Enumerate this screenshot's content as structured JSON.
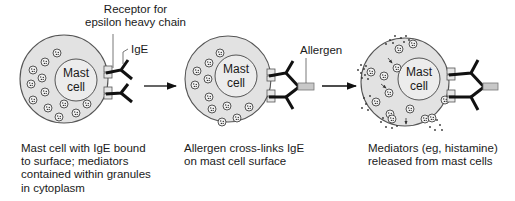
{
  "diagram": {
    "colors": {
      "cell_fill": "#e2e2e2",
      "outline": "#555555",
      "ige": "#111111",
      "receptor_fill": "#e6e6e6",
      "allergen_fill": "#c8c8c8",
      "background": "#ffffff"
    },
    "labels": {
      "receptor": [
        "Receptor for",
        "epsilon heavy chain"
      ],
      "ige": "IgE",
      "allergen": "Allergen"
    },
    "panels": [
      {
        "id": "panel-1",
        "nucleus": [
          "Mast",
          "cell"
        ],
        "caption": [
          "Mast cell with IgE bound",
          "to surface; mediators",
          "contained within granules",
          "in cytoplasm"
        ]
      },
      {
        "id": "panel-2",
        "nucleus": [
          "Mast",
          "cell"
        ],
        "caption": [
          "Allergen cross-links IgE",
          "on mast cell surface"
        ]
      },
      {
        "id": "panel-3",
        "nucleus": [
          "Mast",
          "cell"
        ],
        "caption": [
          "Mediators (eg, histamine)",
          "released from mast cells"
        ]
      }
    ],
    "arrows": [
      {
        "from": "panel-1",
        "to": "panel-2"
      },
      {
        "from": "panel-2",
        "to": "panel-3"
      }
    ]
  }
}
